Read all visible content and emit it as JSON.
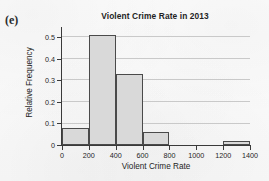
{
  "panel": {
    "label": "(e)"
  },
  "chart_data": {
    "type": "bar",
    "title": "Violent Crime Rate in 2013",
    "xlabel": "Violent Crime Rate",
    "ylabel": "Relative Frequency",
    "bin_edges": [
      0,
      200,
      400,
      600,
      800,
      1000,
      1200,
      1400
    ],
    "categories": [
      "0-200",
      "200-400",
      "400-600",
      "600-800",
      "800-1000",
      "1000-1200",
      "1200-1400"
    ],
    "values": [
      0.08,
      0.51,
      0.33,
      0.06,
      0,
      0,
      0.02
    ],
    "bars": [
      {
        "start": 0,
        "end": 200,
        "value": 0.08
      },
      {
        "start": 200,
        "end": 400,
        "value": 0.51
      },
      {
        "start": 400,
        "end": 600,
        "value": 0.33
      },
      {
        "start": 600,
        "end": 800,
        "value": 0.06
      },
      {
        "start": 1200,
        "end": 1400,
        "value": 0.02
      }
    ],
    "xlim": [
      0,
      1400
    ],
    "ylim": [
      0,
      0.53
    ],
    "xticks": [
      0,
      200,
      400,
      600,
      800,
      1000,
      1200,
      1400
    ],
    "xtick_labels": [
      "0",
      "200",
      "400",
      "600",
      "800",
      "1000",
      "1200",
      "1400"
    ],
    "yticks": [
      0,
      0.1,
      0.2,
      0.3,
      0.4,
      0.5
    ],
    "ytick_labels": [
      "0",
      "0.1",
      "0.2",
      "0.3",
      "0.4",
      "0.5"
    ],
    "grid": "horizontal",
    "legend": null,
    "bar_fill_color": "#d9d9d9",
    "bar_edge_color": "#4a4a4a",
    "grid_color": "#c9c9c9",
    "axis_color": "#3a3a3a"
  }
}
